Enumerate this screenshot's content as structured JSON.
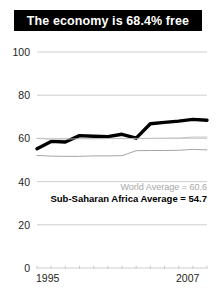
{
  "title": {
    "text": "The economy is 68.4% free"
  },
  "annotations": {
    "world_average": "World Average = 60.6",
    "ssa_average": "Sub-Saharan Africa Average = 54.7"
  },
  "colors": {
    "title_bar_bg": "#000000",
    "title_text": "#ffffff",
    "country_line": "#000000",
    "world_line": "#bdbdbd",
    "ssa_line": "#9a9a9a",
    "gridline": "#c8c8c8",
    "axis_text": "#231f20"
  },
  "chart_data": {
    "type": "line",
    "title": "The economy is 68.4% free",
    "xlabel": "",
    "ylabel": "",
    "xlim": [
      1995,
      2007
    ],
    "ylim": [
      0,
      100
    ],
    "yticks": [
      0,
      20,
      40,
      60,
      80,
      100
    ],
    "ytick_labels": [
      "0",
      "20",
      "40",
      "60",
      "80",
      "100"
    ],
    "xticks": [
      1995,
      1996,
      1997,
      1998,
      1999,
      2000,
      2001,
      2002,
      2003,
      2004,
      2005,
      2006,
      2007
    ],
    "xtick_labels_shown": [
      "1995",
      "2007"
    ],
    "grid": true,
    "legend_position": "inline-annotation",
    "x": [
      1995,
      1996,
      1997,
      1998,
      1999,
      2000,
      2001,
      2002,
      2003,
      2004,
      2005,
      2006,
      2007
    ],
    "series": [
      {
        "name": "Country",
        "color": "#000000",
        "width": "thick",
        "values": [
          55.2,
          58.6,
          58.3,
          61.3,
          61.0,
          60.8,
          61.9,
          60.1,
          66.8,
          67.4,
          68.0,
          68.8,
          68.4
        ]
      },
      {
        "name": "World Average",
        "color": "#bdbdbd",
        "width": "thin",
        "values": [
          60.0,
          59.6,
          59.7,
          59.8,
          59.8,
          59.9,
          59.9,
          60.0,
          60.0,
          60.1,
          60.2,
          60.6,
          60.6
        ]
      },
      {
        "name": "Sub-Saharan Africa Average",
        "color": "#9a9a9a",
        "width": "thin",
        "values": [
          52.1,
          51.8,
          51.7,
          51.7,
          51.9,
          51.9,
          52.0,
          54.3,
          54.4,
          54.4,
          54.5,
          54.9,
          54.7
        ]
      }
    ]
  }
}
